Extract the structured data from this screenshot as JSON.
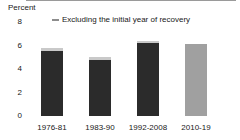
{
  "chart_data": {
    "type": "bar",
    "title": "",
    "subtitle": "",
    "ylabel": "Percent",
    "xlabel": "",
    "ylim": [
      0,
      8
    ],
    "yticks": [
      0,
      2,
      4,
      6,
      8
    ],
    "ytick_labels": [
      "0",
      "2",
      "4",
      "6",
      "8"
    ],
    "grid": false,
    "legend_position": "top-center",
    "legend": [
      {
        "name": "Excluding the initial year of recovery",
        "marker": "dash",
        "color": "#c9c9c9"
      }
    ],
    "categories": [
      "1976-81",
      "1983-90",
      "1992-2008",
      "2010-19"
    ],
    "series": [
      {
        "name": "Full expansion",
        "color": "#2b2b2b",
        "values": [
          5.5,
          4.8,
          6.2,
          6.1
        ],
        "highlight_color": "#a0a0a0",
        "highlight_index": 3
      },
      {
        "name": "Excluding the initial year of recovery",
        "color": "#c9c9c9",
        "values": [
          5.8,
          5.0,
          6.4,
          null
        ]
      }
    ],
    "annotations": []
  },
  "axis": {
    "y_title": "Percent"
  },
  "legend": {
    "marker_name": "legend-dash-marker",
    "label": "Excluding the initial year of recovery"
  }
}
